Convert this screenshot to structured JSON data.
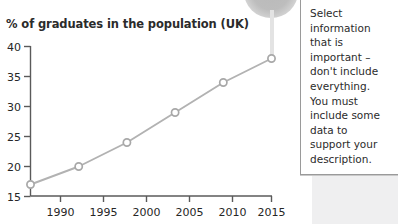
{
  "decor": {
    "pin_icon": "speech-bubble-pin-icon",
    "panel_color": "#efeff0"
  },
  "note": {
    "text": "Select information that is important – don't include everything. You must include some data to support your description."
  },
  "chart_data": {
    "type": "line",
    "title": "% of graduates in the population (UK)",
    "xlabel": "",
    "ylabel": "",
    "categories": [
      1990,
      1995,
      2000,
      2005,
      2010,
      2015
    ],
    "x_tick_labels": [
      "1990",
      "1995",
      "2000",
      "2005",
      "2010",
      "2015"
    ],
    "y_tick_labels": [
      "15",
      "20",
      "25",
      "30",
      "35",
      "40"
    ],
    "values": [
      17,
      20,
      24,
      29,
      34,
      38
    ],
    "series": [
      {
        "name": "% of graduates in the population (UK)",
        "values": [
          17,
          20,
          24,
          29,
          34,
          38
        ]
      }
    ],
    "xlim": [
      1988.2,
      2016.6
    ],
    "ylim": [
      15,
      40
    ],
    "grid": false,
    "legend": false,
    "line_color": "#b2b2b2",
    "marker": "open-circle",
    "marker_edge_color": "#a8a8a8",
    "marker_face_color": "#ffffff",
    "axis_color": "#5a5a5a"
  }
}
